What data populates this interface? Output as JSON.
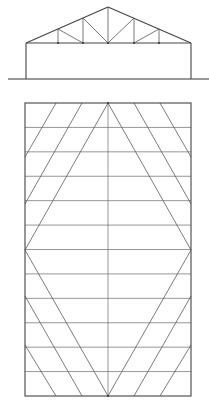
{
  "diagram": {
    "type": "building truss elevation and roof plan",
    "colors": {
      "line": "#555555",
      "background": "#ffffff"
    },
    "elevation": {
      "name": "truss-elevation",
      "ground": {
        "x1": 8,
        "y": 79,
        "x2": 209
      },
      "walls": {
        "left_x": 26,
        "right_x": 191,
        "eave_y": 43,
        "base_y": 79
      },
      "apex": {
        "x": 108,
        "y": 7
      },
      "bottom_chord_y": 43,
      "posts": [
        {
          "x": 58,
          "top_y": 29
        },
        {
          "x": 83,
          "top_y": 18
        },
        {
          "x": 108,
          "top_y": 7
        },
        {
          "x": 134,
          "top_y": 18
        },
        {
          "x": 159,
          "top_y": 29
        }
      ],
      "diagonals": [
        {
          "x1": 58,
          "y1": 29,
          "x2": 83,
          "y2": 43
        },
        {
          "x1": 83,
          "y1": 18,
          "x2": 108,
          "y2": 43
        },
        {
          "x1": 134,
          "y1": 18,
          "x2": 108,
          "y2": 43
        },
        {
          "x1": 159,
          "y1": 29,
          "x2": 134,
          "y2": 43
        }
      ]
    },
    "plan": {
      "name": "roof-plan",
      "rect": {
        "x": 25,
        "y": 103,
        "width": 166,
        "height": 293
      },
      "center_x": 108,
      "mid_y": 250,
      "horizontal_count": 11,
      "diamond": [
        {
          "x": 108,
          "y": 103
        },
        {
          "x": 191,
          "y": 250
        },
        {
          "x": 108,
          "y": 396
        },
        {
          "x": 25,
          "y": 250
        }
      ],
      "braces": [
        {
          "x1": 82,
          "y1": 103,
          "x2": 25,
          "y2": 204
        },
        {
          "x1": 56,
          "y1": 103,
          "x2": 25,
          "y2": 157
        },
        {
          "x1": 134,
          "y1": 103,
          "x2": 191,
          "y2": 204
        },
        {
          "x1": 160,
          "y1": 103,
          "x2": 191,
          "y2": 157
        },
        {
          "x1": 82,
          "y1": 396,
          "x2": 25,
          "y2": 296
        },
        {
          "x1": 56,
          "y1": 396,
          "x2": 25,
          "y2": 345
        },
        {
          "x1": 134,
          "y1": 396,
          "x2": 191,
          "y2": 296
        },
        {
          "x1": 160,
          "y1": 396,
          "x2": 191,
          "y2": 345
        }
      ]
    }
  }
}
